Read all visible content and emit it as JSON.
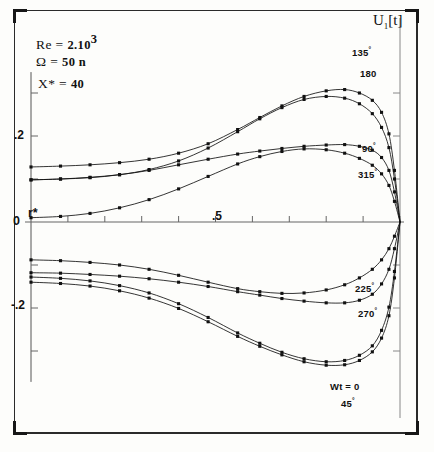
{
  "figure": {
    "title": "U",
    "title_sub": "1",
    "title_tail": "[t]",
    "x_axis_label": "r*",
    "origin_label": "0",
    "y_ticks": [
      {
        "label": ".2",
        "value": 0.2
      },
      {
        "label": "0",
        "value": 0.0
      },
      {
        "label": "-.2",
        "value": -0.2
      }
    ],
    "x_ticks": [
      {
        "label": ".5",
        "value": 0.5
      }
    ]
  },
  "parameters": [
    {
      "symbol": "Re",
      "eq": "=",
      "value": "2.10",
      "exponent": "3"
    },
    {
      "symbol": "Ω",
      "eq": "=",
      "value": "50 n",
      "exponent": ""
    },
    {
      "symbol": "X*",
      "eq": "=",
      "value": "40",
      "exponent": ""
    }
  ],
  "annotations": [
    {
      "text": "135",
      "degree": "°",
      "x": 352,
      "y": 46
    },
    {
      "text": "180",
      "degree": "",
      "x": 360,
      "y": 68
    },
    {
      "text": "90",
      "degree": "°",
      "x": 362,
      "y": 142
    },
    {
      "text": "315",
      "degree": "°",
      "x": 358,
      "y": 168
    },
    {
      "text": "225",
      "degree": "°",
      "x": 355,
      "y": 282
    },
    {
      "text": "270",
      "degree": "°",
      "x": 358,
      "y": 307
    },
    {
      "text": "Wt = 0",
      "degree": "",
      "x": 330,
      "y": 381
    },
    {
      "text": "45",
      "degree": "°",
      "x": 341,
      "y": 397
    }
  ],
  "chart_data": {
    "type": "line",
    "title": "U1[t]",
    "xlabel": "r*",
    "ylabel": "U1[t]",
    "xlim": [
      0,
      1
    ],
    "ylim": [
      -0.33,
      0.33
    ],
    "grid": false,
    "legend_position": "inline-annotations",
    "axis_style": "crossing-axes-at-origin",
    "parameters": {
      "Re": "2.10^3",
      "Omega": "50 n",
      "X*": "40"
    },
    "x": [
      0.0,
      0.08,
      0.16,
      0.24,
      0.32,
      0.4,
      0.48,
      0.56,
      0.62,
      0.68,
      0.74,
      0.8,
      0.85,
      0.89,
      0.925,
      0.95,
      0.97,
      0.985,
      1.0
    ],
    "series": [
      {
        "name": "135°",
        "color": "#111111",
        "values": [
          0.128,
          0.13,
          0.133,
          0.138,
          0.146,
          0.16,
          0.182,
          0.215,
          0.243,
          0.27,
          0.292,
          0.305,
          0.308,
          0.3,
          0.283,
          0.255,
          0.205,
          0.12,
          0.0
        ]
      },
      {
        "name": "180°",
        "color": "#111111",
        "values": [
          0.098,
          0.1,
          0.103,
          0.11,
          0.122,
          0.142,
          0.172,
          0.21,
          0.24,
          0.266,
          0.285,
          0.292,
          0.288,
          0.275,
          0.252,
          0.22,
          0.173,
          0.1,
          0.0
        ]
      },
      {
        "name": "90°",
        "color": "#111111",
        "values": [
          0.098,
          0.1,
          0.104,
          0.11,
          0.12,
          0.133,
          0.146,
          0.158,
          0.165,
          0.171,
          0.176,
          0.179,
          0.18,
          0.176,
          0.167,
          0.15,
          0.12,
          0.07,
          0.0
        ]
      },
      {
        "name": "315°",
        "color": "#111111",
        "values": [
          0.01,
          0.013,
          0.02,
          0.033,
          0.052,
          0.077,
          0.106,
          0.135,
          0.152,
          0.164,
          0.17,
          0.168,
          0.16,
          0.148,
          0.132,
          0.112,
          0.085,
          0.048,
          0.0
        ]
      },
      {
        "name": "225°",
        "color": "#111111",
        "values": [
          -0.088,
          -0.09,
          -0.094,
          -0.1,
          -0.11,
          -0.124,
          -0.14,
          -0.155,
          -0.162,
          -0.166,
          -0.165,
          -0.158,
          -0.146,
          -0.13,
          -0.11,
          -0.088,
          -0.062,
          -0.033,
          0.0
        ]
      },
      {
        "name": "270°",
        "color": "#111111",
        "values": [
          -0.118,
          -0.119,
          -0.122,
          -0.126,
          -0.132,
          -0.14,
          -0.15,
          -0.162,
          -0.17,
          -0.178,
          -0.184,
          -0.188,
          -0.188,
          -0.182,
          -0.168,
          -0.144,
          -0.11,
          -0.062,
          0.0
        ]
      },
      {
        "name": "Wt = 0",
        "color": "#111111",
        "values": [
          -0.128,
          -0.131,
          -0.137,
          -0.148,
          -0.165,
          -0.19,
          -0.222,
          -0.258,
          -0.282,
          -0.303,
          -0.318,
          -0.325,
          -0.322,
          -0.31,
          -0.288,
          -0.252,
          -0.198,
          -0.115,
          0.0
        ]
      },
      {
        "name": "45°",
        "color": "#111111",
        "values": [
          -0.14,
          -0.143,
          -0.149,
          -0.16,
          -0.177,
          -0.201,
          -0.232,
          -0.266,
          -0.289,
          -0.309,
          -0.325,
          -0.333,
          -0.332,
          -0.322,
          -0.302,
          -0.27,
          -0.218,
          -0.13,
          0.0
        ]
      }
    ]
  }
}
